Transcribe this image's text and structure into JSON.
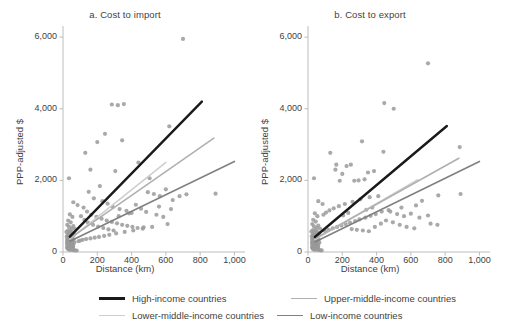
{
  "figure": {
    "background": "#ffffff",
    "text_color": "#3f3f3f"
  },
  "legend": {
    "position": "bottom",
    "items": [
      {
        "label": "High-income countries",
        "color": "#1a1a1a",
        "width": 2.4
      },
      {
        "label": "Upper-middle-income countries",
        "color": "#b0b0b0",
        "width": 1.5
      },
      {
        "label": "Lower-middle-income countries",
        "color": "#cfcfcf",
        "width": 1.5
      },
      {
        "label": "Low-income countries",
        "color": "#808080",
        "width": 1.5
      }
    ]
  },
  "chart_data": [
    {
      "type": "scatter",
      "title": "a. Cost to import",
      "xlabel": "Distance (km)",
      "ylabel": "PPP-adjusted $",
      "xlim": [
        0,
        1050
      ],
      "ylim": [
        0,
        6200
      ],
      "xticks": [
        0,
        200,
        400,
        600,
        800,
        1000
      ],
      "xticklabels": [
        "0",
        "200",
        "400",
        "600",
        "800",
        "1,000"
      ],
      "yticks": [
        0,
        2000,
        4000,
        6000
      ],
      "yticklabels": [
        "0",
        "2,000",
        "4,000",
        "6,000"
      ],
      "grid": false,
      "point_color": "#9a9a9a",
      "point_size": 2.1,
      "series": [
        {
          "name": "High-income countries",
          "type": "line",
          "color": "#1a1a1a",
          "width": 2.4,
          "x": [
            40,
            810
          ],
          "y": [
            430,
            4200
          ]
        },
        {
          "name": "Upper-middle-income countries",
          "type": "line",
          "color": "#b0b0b0",
          "width": 1.6,
          "x": [
            40,
            880
          ],
          "y": [
            380,
            3180
          ]
        },
        {
          "name": "Lower-middle-income countries",
          "type": "line",
          "color": "#cfcfcf",
          "width": 1.6,
          "x": [
            40,
            600
          ],
          "y": [
            360,
            2500
          ]
        },
        {
          "name": "Low-income countries",
          "type": "line",
          "color": "#808080",
          "width": 1.6,
          "x": [
            40,
            1000
          ],
          "y": [
            300,
            2530
          ]
        }
      ],
      "points": [
        [
          35,
          2060
        ],
        [
          60,
          1390
        ],
        [
          85,
          1310
        ],
        [
          40,
          1050
        ],
        [
          55,
          980
        ],
        [
          30,
          880
        ],
        [
          45,
          830
        ],
        [
          25,
          760
        ],
        [
          60,
          720
        ],
        [
          35,
          700
        ],
        [
          50,
          650
        ],
        [
          70,
          640
        ],
        [
          30,
          600
        ],
        [
          45,
          580
        ],
        [
          20,
          560
        ],
        [
          55,
          545
        ],
        [
          38,
          520
        ],
        [
          65,
          505
        ],
        [
          28,
          490
        ],
        [
          48,
          470
        ],
        [
          33,
          455
        ],
        [
          58,
          440
        ],
        [
          22,
          430
        ],
        [
          42,
          415
        ],
        [
          30,
          400
        ],
        [
          52,
          390
        ],
        [
          26,
          375
        ],
        [
          46,
          360
        ],
        [
          36,
          350
        ],
        [
          62,
          340
        ],
        [
          24,
          330
        ],
        [
          44,
          320
        ],
        [
          32,
          310
        ],
        [
          56,
          300
        ],
        [
          28,
          290
        ],
        [
          48,
          280
        ],
        [
          38,
          270
        ],
        [
          66,
          262
        ],
        [
          23,
          255
        ],
        [
          43,
          248
        ],
        [
          34,
          240
        ],
        [
          54,
          232
        ],
        [
          27,
          225
        ],
        [
          47,
          218
        ],
        [
          37,
          210
        ],
        [
          60,
          205
        ],
        [
          25,
          198
        ],
        [
          45,
          190
        ],
        [
          31,
          185
        ],
        [
          51,
          178
        ],
        [
          29,
          170
        ],
        [
          49,
          165
        ],
        [
          39,
          158
        ],
        [
          59,
          152
        ],
        [
          26,
          145
        ],
        [
          46,
          140
        ],
        [
          36,
          133
        ],
        [
          56,
          128
        ],
        [
          24,
          122
        ],
        [
          44,
          117
        ],
        [
          34,
          110
        ],
        [
          54,
          105
        ],
        [
          28,
          98
        ],
        [
          48,
          92
        ],
        [
          38,
          86
        ],
        [
          58,
          80
        ],
        [
          30,
          74
        ],
        [
          50,
          68
        ],
        [
          40,
          60
        ],
        [
          60,
          54
        ],
        [
          70,
          48
        ],
        [
          80,
          42
        ],
        [
          130,
          2770
        ],
        [
          160,
          2300
        ],
        [
          200,
          3070
        ],
        [
          245,
          3300
        ],
        [
          285,
          4120
        ],
        [
          320,
          4100
        ],
        [
          355,
          4130
        ],
        [
          700,
          5950
        ],
        [
          620,
          3510
        ],
        [
          345,
          3120
        ],
        [
          215,
          1840
        ],
        [
          305,
          2260
        ],
        [
          440,
          2500
        ],
        [
          505,
          2060
        ],
        [
          150,
          1680
        ],
        [
          180,
          1500
        ],
        [
          230,
          1420
        ],
        [
          260,
          1350
        ],
        [
          290,
          1260
        ],
        [
          330,
          1200
        ],
        [
          370,
          1150
        ],
        [
          400,
          1090
        ],
        [
          120,
          1240
        ],
        [
          140,
          1130
        ],
        [
          165,
          1040
        ],
        [
          195,
          980
        ],
        [
          225,
          930
        ],
        [
          255,
          880
        ],
        [
          285,
          840
        ],
        [
          315,
          800
        ],
        [
          345,
          760
        ],
        [
          375,
          730
        ],
        [
          405,
          700
        ],
        [
          435,
          670
        ],
        [
          465,
          650
        ],
        [
          495,
          1670
        ],
        [
          530,
          1620
        ],
        [
          565,
          1560
        ],
        [
          600,
          1750
        ],
        [
          640,
          1450
        ],
        [
          680,
          1560
        ],
        [
          720,
          1610
        ],
        [
          890,
          1630
        ],
        [
          560,
          1270
        ],
        [
          610,
          780
        ],
        [
          520,
          700
        ],
        [
          470,
          690
        ],
        [
          410,
          600
        ],
        [
          360,
          560
        ],
        [
          310,
          520
        ],
        [
          270,
          480
        ],
        [
          240,
          450
        ],
        [
          210,
          420
        ],
        [
          185,
          400
        ],
        [
          160,
          380
        ],
        [
          135,
          360
        ],
        [
          115,
          340
        ],
        [
          100,
          320
        ],
        [
          90,
          300
        ],
        [
          105,
          1000
        ],
        [
          125,
          900
        ],
        [
          145,
          820
        ],
        [
          175,
          760
        ],
        [
          205,
          710
        ],
        [
          235,
          670
        ],
        [
          265,
          630
        ],
        [
          295,
          600
        ],
        [
          325,
          1000
        ],
        [
          385,
          1080
        ],
        [
          425,
          1320
        ],
        [
          455,
          1210
        ],
        [
          485,
          1120
        ],
        [
          545,
          1040
        ],
        [
          585,
          980
        ],
        [
          630,
          1200
        ]
      ]
    },
    {
      "type": "scatter",
      "title": "b. Cost to export",
      "xlabel": "Distance (km)",
      "ylabel": "PPP-adjusted $",
      "xlim": [
        0,
        1050
      ],
      "ylim": [
        0,
        6200
      ],
      "xticks": [
        0,
        200,
        400,
        600,
        800,
        1000
      ],
      "xticklabels": [
        "0",
        "200",
        "400",
        "600",
        "800",
        "1,000"
      ],
      "yticks": [
        0,
        2000,
        4000,
        6000
      ],
      "yticklabels": [
        "0",
        "2,000",
        "4,000",
        "6,000"
      ],
      "grid": false,
      "point_color": "#9a9a9a",
      "point_size": 2.1,
      "series": [
        {
          "name": "High-income countries",
          "type": "line",
          "color": "#1a1a1a",
          "width": 2.4,
          "x": [
            40,
            810
          ],
          "y": [
            420,
            3520
          ]
        },
        {
          "name": "Upper-middle-income countries",
          "type": "line",
          "color": "#b0b0b0",
          "width": 1.6,
          "x": [
            40,
            880
          ],
          "y": [
            370,
            2620
          ]
        },
        {
          "name": "Lower-middle-income countries",
          "type": "line",
          "color": "#cfcfcf",
          "width": 1.6,
          "x": [
            40,
            640
          ],
          "y": [
            350,
            2020
          ]
        },
        {
          "name": "Low-income countries",
          "type": "line",
          "color": "#808080",
          "width": 1.6,
          "x": [
            40,
            1000
          ],
          "y": [
            280,
            2530
          ]
        }
      ],
      "points": [
        [
          35,
          2060
        ],
        [
          60,
          1420
        ],
        [
          85,
          1340
        ],
        [
          40,
          1080
        ],
        [
          55,
          1000
        ],
        [
          30,
          900
        ],
        [
          45,
          850
        ],
        [
          25,
          780
        ],
        [
          60,
          740
        ],
        [
          35,
          715
        ],
        [
          50,
          670
        ],
        [
          70,
          655
        ],
        [
          30,
          615
        ],
        [
          45,
          595
        ],
        [
          20,
          575
        ],
        [
          55,
          558
        ],
        [
          38,
          535
        ],
        [
          65,
          518
        ],
        [
          28,
          500
        ],
        [
          48,
          482
        ],
        [
          33,
          466
        ],
        [
          58,
          450
        ],
        [
          22,
          438
        ],
        [
          42,
          424
        ],
        [
          30,
          410
        ],
        [
          52,
          398
        ],
        [
          26,
          384
        ],
        [
          46,
          368
        ],
        [
          36,
          356
        ],
        [
          62,
          346
        ],
        [
          24,
          336
        ],
        [
          44,
          326
        ],
        [
          32,
          316
        ],
        [
          56,
          306
        ],
        [
          28,
          296
        ],
        [
          48,
          286
        ],
        [
          38,
          276
        ],
        [
          66,
          268
        ],
        [
          23,
          260
        ],
        [
          43,
          252
        ],
        [
          34,
          244
        ],
        [
          54,
          236
        ],
        [
          27,
          229
        ],
        [
          47,
          222
        ],
        [
          37,
          214
        ],
        [
          60,
          208
        ],
        [
          25,
          202
        ],
        [
          45,
          194
        ],
        [
          31,
          188
        ],
        [
          51,
          181
        ],
        [
          29,
          174
        ],
        [
          49,
          168
        ],
        [
          39,
          161
        ],
        [
          59,
          155
        ],
        [
          26,
          148
        ],
        [
          46,
          142
        ],
        [
          36,
          136
        ],
        [
          56,
          130
        ],
        [
          24,
          124
        ],
        [
          44,
          119
        ],
        [
          34,
          112
        ],
        [
          54,
          107
        ],
        [
          28,
          100
        ],
        [
          48,
          94
        ],
        [
          38,
          88
        ],
        [
          58,
          82
        ],
        [
          30,
          76
        ],
        [
          50,
          70
        ],
        [
          40,
          62
        ],
        [
          60,
          56
        ],
        [
          70,
          50
        ],
        [
          80,
          44
        ],
        [
          130,
          2770
        ],
        [
          160,
          2300
        ],
        [
          185,
          1990
        ],
        [
          225,
          2400
        ],
        [
          250,
          2440
        ],
        [
          270,
          1990
        ],
        [
          295,
          2000
        ],
        [
          330,
          2030
        ],
        [
          385,
          2260
        ],
        [
          440,
          2800
        ],
        [
          445,
          4160
        ],
        [
          500,
          4000
        ],
        [
          700,
          5270
        ],
        [
          885,
          2930
        ],
        [
          315,
          3090
        ],
        [
          350,
          2220
        ],
        [
          200,
          2180
        ],
        [
          165,
          2440
        ],
        [
          410,
          1560
        ],
        [
          360,
          1530
        ],
        [
          305,
          1470
        ],
        [
          260,
          1400
        ],
        [
          215,
          1340
        ],
        [
          180,
          1280
        ],
        [
          150,
          1220
        ],
        [
          125,
          1160
        ],
        [
          105,
          1100
        ],
        [
          90,
          1040
        ],
        [
          480,
          1130
        ],
        [
          520,
          1060
        ],
        [
          560,
          1000
        ],
        [
          600,
          1070
        ],
        [
          650,
          960
        ],
        [
          700,
          1020
        ],
        [
          760,
          1580
        ],
        [
          890,
          1620
        ],
        [
          630,
          1300
        ],
        [
          545,
          1240
        ],
        [
          470,
          1170
        ],
        [
          430,
          1130
        ],
        [
          395,
          1060
        ],
        [
          365,
          1010
        ],
        [
          335,
          960
        ],
        [
          300,
          910
        ],
        [
          275,
          860
        ],
        [
          245,
          820
        ],
        [
          220,
          780
        ],
        [
          195,
          740
        ],
        [
          170,
          700
        ],
        [
          145,
          660
        ],
        [
          120,
          620
        ],
        [
          100,
          580
        ],
        [
          255,
          640
        ],
        [
          285,
          620
        ],
        [
          320,
          600
        ],
        [
          355,
          580
        ],
        [
          390,
          700
        ],
        [
          425,
          790
        ],
        [
          455,
          880
        ],
        [
          495,
          830
        ],
        [
          535,
          760
        ],
        [
          575,
          700
        ],
        [
          620,
          660
        ],
        [
          665,
          1430
        ],
        [
          715,
          790
        ],
        [
          755,
          760
        ],
        [
          340,
          1180
        ],
        [
          375,
          1240
        ],
        [
          235,
          1090
        ],
        [
          205,
          1020
        ]
      ]
    }
  ]
}
